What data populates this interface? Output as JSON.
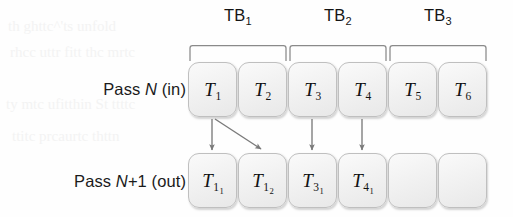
{
  "figure": {
    "rows": [
      {
        "id": "pass-n",
        "label_prefix": "Pass ",
        "label_var": "N",
        "label_suffix": " (in)",
        "label_full": "Pass N (in)",
        "top": 62,
        "boxes": [
          {
            "name": "task-t1",
            "base": "T",
            "sub": "1",
            "subsub": "",
            "x": 188,
            "empty": false
          },
          {
            "name": "task-t2",
            "base": "T",
            "sub": "2",
            "subsub": "",
            "x": 238,
            "empty": false
          },
          {
            "name": "task-t3",
            "base": "T",
            "sub": "3",
            "subsub": "",
            "x": 288,
            "empty": false
          },
          {
            "name": "task-t4",
            "base": "T",
            "sub": "4",
            "subsub": "",
            "x": 338,
            "empty": false
          },
          {
            "name": "task-t5",
            "base": "T",
            "sub": "5",
            "subsub": "",
            "x": 388,
            "empty": false
          },
          {
            "name": "task-t6",
            "base": "T",
            "sub": "6",
            "subsub": "",
            "x": 438,
            "empty": false
          }
        ]
      },
      {
        "id": "pass-n-plus-1",
        "label_prefix": "Pass ",
        "label_var": "N",
        "label_suffix": "+1 (out)",
        "label_full": "Pass N+1 (out)",
        "top": 153,
        "boxes": [
          {
            "name": "task-t11",
            "base": "T",
            "sub": "1",
            "subsub": "1",
            "x": 188,
            "empty": false
          },
          {
            "name": "task-t12",
            "base": "T",
            "sub": "1",
            "subsub": "2",
            "x": 238,
            "empty": false
          },
          {
            "name": "task-t31",
            "base": "T",
            "sub": "3",
            "subsub": "1",
            "x": 288,
            "empty": false
          },
          {
            "name": "task-t41",
            "base": "T",
            "sub": "4",
            "subsub": "1",
            "x": 338,
            "empty": false
          },
          {
            "name": "task-empty-5",
            "base": "",
            "sub": "",
            "subsub": "",
            "x": 388,
            "empty": true
          },
          {
            "name": "task-empty-6",
            "base": "",
            "sub": "",
            "subsub": "",
            "x": 438,
            "empty": true
          }
        ]
      }
    ],
    "thread_blocks": [
      {
        "name": "thread-block-tb1",
        "base": "TB",
        "sub": "1",
        "center": 238,
        "left": 190,
        "right": 286
      },
      {
        "name": "thread-block-tb2",
        "base": "TB",
        "sub": "2",
        "center": 338,
        "left": 290,
        "right": 386
      },
      {
        "name": "thread-block-tb3",
        "base": "TB",
        "sub": "3",
        "center": 438,
        "left": 390,
        "right": 486
      }
    ],
    "arrows": [
      {
        "name": "arrow-t1-to-t11",
        "kind": "vertical",
        "x1": 212,
        "y1": 119,
        "x2": 212,
        "y2": 150
      },
      {
        "name": "arrow-t1-to-t12",
        "kind": "diagonal",
        "x1": 214,
        "y1": 119,
        "x2": 262,
        "y2": 150
      },
      {
        "name": "arrow-t3-to-t31",
        "kind": "vertical",
        "x1": 312,
        "y1": 119,
        "x2": 312,
        "y2": 150
      },
      {
        "name": "arrow-t4-to-t41",
        "kind": "vertical",
        "x1": 362,
        "y1": 119,
        "x2": 362,
        "y2": 150
      }
    ],
    "bleed_text": [
      "th  ghttc^'ts  unfold",
      "rhcc  uttr  fitt   thc  mrtc",
      "ty  mtc  ufitthin  St   ttttc",
      "ttitc  prcaurtc  thttn"
    ],
    "colors": {
      "box_fill": "#f1f1f1",
      "box_border": "#bfbfbf",
      "arrow": "#7a7a7a",
      "bracket": "#8a8a8a",
      "text": "#121212",
      "background": "#fefefe"
    }
  }
}
